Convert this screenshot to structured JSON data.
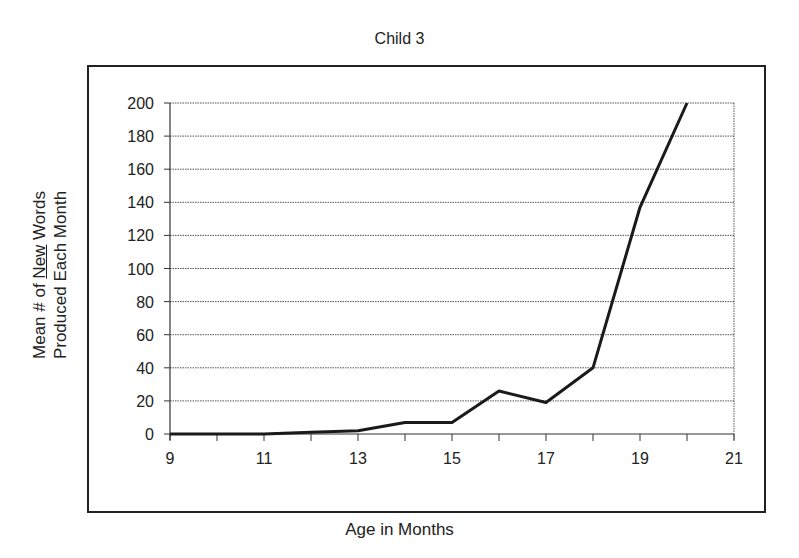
{
  "chart_data": {
    "type": "line",
    "title": "Child 3",
    "xlabel": "Age in Months",
    "ylabel_line1": "Mean # of New Words",
    "ylabel_line2": "Produced Each Month",
    "ylabel_underlined_word": "New",
    "x": [
      9,
      10,
      11,
      12,
      13,
      14,
      15,
      16,
      17,
      18,
      19,
      20
    ],
    "series": [
      {
        "name": "Child 3",
        "values": [
          0,
          0,
          0,
          1,
          2,
          7,
          7,
          26,
          19,
          40,
          137,
          200
        ],
        "color": "#1a1a1a"
      }
    ],
    "xlim": [
      9,
      21
    ],
    "ylim": [
      0,
      200
    ],
    "x_ticks": [
      9,
      11,
      13,
      15,
      17,
      19,
      21
    ],
    "y_ticks": [
      0,
      20,
      40,
      60,
      80,
      100,
      120,
      140,
      160,
      180,
      200
    ],
    "grid": {
      "horizontal": true,
      "vertical": false,
      "style": "dotted"
    },
    "legend": "none"
  },
  "labels": {
    "title": "Child 3",
    "xlabel": "Age in Months",
    "ylabel_pre": "Mean # of ",
    "ylabel_under": "New",
    "ylabel_post": " Words",
    "ylabel_line2": "Produced Each Month"
  }
}
